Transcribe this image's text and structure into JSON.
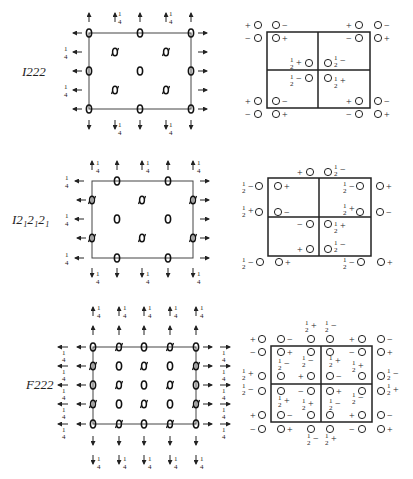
{
  "figure": {
    "panels": [
      {
        "name": "I222",
        "label": "I222",
        "symmetry_diagram": {
          "top_quarter_labels": [
            "1/4",
            "1/4"
          ],
          "bottom_quarter_labels": [
            "1/4",
            "1/4"
          ],
          "left_quarter_labels": [
            "1/4",
            "1/4"
          ]
        },
        "position_diagram": {
          "markers": [
            {
              "x": 0,
              "y": 0,
              "s": "+ ○"
            },
            {
              "x": 1,
              "y": 0,
              "s": "○ −"
            },
            {
              "x": 0,
              "y": 1,
              "s": "− ○"
            },
            {
              "x": 1,
              "y": 1,
              "s": "○ +"
            },
            {
              "x": 2,
              "y": 0,
              "s": "+ ○"
            },
            {
              "x": 3,
              "y": 0,
              "s": "○ −"
            },
            {
              "x": 2,
              "y": 1,
              "s": "− ○"
            },
            {
              "x": 3,
              "y": 1,
              "s": "○ +"
            },
            {
              "s": "½+ ○"
            },
            {
              "s": "○ ½−"
            },
            {
              "s": "½− ○"
            },
            {
              "s": "○ ½+"
            },
            {
              "s": "+ ○"
            },
            {
              "s": "○ −"
            },
            {
              "s": "− ○"
            },
            {
              "s": "○ +"
            },
            {
              "s": "+ ○"
            },
            {
              "s": "○ −"
            },
            {
              "s": "− ○"
            },
            {
              "s": "○ +"
            }
          ]
        }
      },
      {
        "name": "I212121",
        "label": "I2₁2₁2₁",
        "symmetry_diagram": {
          "top_quarter_labels": [
            "1/4",
            "1/4",
            "1/4"
          ],
          "bottom_quarter_labels": [
            "1/4",
            "1/4",
            "1/4"
          ],
          "left_quarter_labels": [
            "1/4",
            "1/4",
            "1/4"
          ]
        },
        "position_diagram": {
          "markers": [
            {
              "s": "+ ○"
            },
            {
              "s": "○ ½−"
            },
            {
              "s": "½− ○"
            },
            {
              "s": "○ +"
            },
            {
              "s": "½− ○"
            },
            {
              "s": "○ +"
            },
            {
              "s": "½+ ○"
            },
            {
              "s": "○ −"
            },
            {
              "s": "½+ ○"
            },
            {
              "s": "○ −"
            },
            {
              "s": "− ○"
            },
            {
              "s": "○ ½+"
            },
            {
              "s": "+ ○"
            },
            {
              "s": "○ ½−"
            },
            {
              "s": "½− ○"
            },
            {
              "s": "○ +"
            },
            {
              "s": "½− ○"
            },
            {
              "s": "○ +"
            }
          ]
        }
      },
      {
        "name": "F222",
        "label": "F222",
        "symmetry_diagram": {
          "top_quarter_labels": [
            "1/4",
            "1/4",
            "1/4",
            "1/4",
            "1/4"
          ],
          "bottom_quarter_labels": [
            "1/4",
            "1/4",
            "1/4",
            "1/4",
            "1/4"
          ],
          "left_quarter_labels": [
            "1/4",
            "1/4",
            "1/4",
            "1/4",
            "1/4"
          ],
          "right_quarter_labels": [
            "1/4",
            "1/4",
            "1/4",
            "1/4",
            "1/4"
          ]
        },
        "position_diagram": {
          "top_labels": [
            "½+",
            "½−"
          ],
          "bottom_labels": [
            "½−",
            "½+"
          ]
        }
      }
    ]
  }
}
